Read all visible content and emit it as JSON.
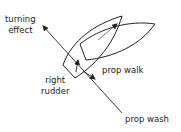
{
  "labels": {
    "turning_effect": [
      "turning",
      "effect"
    ],
    "right_rudder": [
      "right",
      "rudder"
    ],
    "prop_walk": "prop walk",
    "prop_wash": "prop wash"
  },
  "colors": {
    "stroke": "#222222",
    "background": "#ffffff"
  }
}
